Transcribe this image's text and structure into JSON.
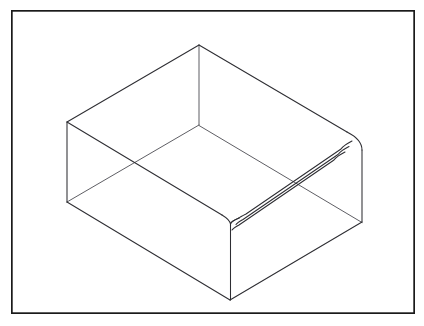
{
  "document": {
    "title": "Isometric Open Box Line Drawing",
    "subject": "open rectangular tray",
    "style": "technical wireframe line drawing",
    "background_color": "#ffffff",
    "line_color": "#2e2e33",
    "hidden_line_color": "#55555c",
    "frame_color": "#1a1a1a"
  },
  "frame": {
    "name": "page-border",
    "x": 11,
    "y": 10,
    "width": 404,
    "height": 304,
    "stroke_width": 1.7
  },
  "geometry": {
    "projection": "isometric",
    "description": "Open-topped rectangular box viewed from above-front, drawn in wireframe with hidden edges visible and a banded rim along the right-front wall.",
    "points": {
      "top_back": [
        199,
        45
      ],
      "top_left": [
        67,
        122
      ],
      "top_right": [
        355,
        142
      ],
      "top_front": [
        230,
        222
      ],
      "bottom_back": [
        199,
        125
      ],
      "bottom_left": [
        67,
        202
      ],
      "bottom_right": [
        362,
        222
      ],
      "bottom_front": [
        230,
        300
      ]
    },
    "rim_band": {
      "description": "Three parallel lines along the right-hand top rim forming wall thickness",
      "offsets": [
        0,
        5,
        10
      ],
      "corner_radius": 9
    },
    "outer_outline": "M199,45 L67,122 L67,202 L230,300 L362,222 L355,142 Z",
    "vertical_edges": [
      {
        "name": "back-vertical",
        "from": [
          199,
          45
        ],
        "to": [
          199,
          125
        ],
        "hidden": true
      },
      {
        "name": "left-vertical",
        "from": [
          67,
          122
        ],
        "to": [
          67,
          202
        ],
        "hidden": false
      },
      {
        "name": "right-vertical",
        "from": [
          362,
          148
        ],
        "to": [
          362,
          222
        ],
        "hidden": false
      },
      {
        "name": "front-vertical",
        "from": [
          230,
          222
        ],
        "to": [
          230,
          300
        ],
        "hidden": false
      }
    ],
    "floor_edges": [
      {
        "name": "floor-back-left",
        "from": [
          199,
          125
        ],
        "to": [
          67,
          202
        ],
        "hidden": true
      },
      {
        "name": "floor-back-right",
        "from": [
          199,
          125
        ],
        "to": [
          340,
          208
        ],
        "hidden": true
      },
      {
        "name": "floor-front-left",
        "from": [
          67,
          202
        ],
        "to": [
          230,
          300
        ],
        "hidden": false
      },
      {
        "name": "floor-front-right",
        "from": [
          230,
          300
        ],
        "to": [
          362,
          222
        ],
        "hidden": false
      }
    ],
    "top_rim_edges": [
      {
        "name": "rim-back-left",
        "from": [
          199,
          45
        ],
        "to": [
          67,
          122
        ]
      },
      {
        "name": "rim-back-right",
        "from": [
          199,
          45
        ],
        "to": [
          355,
          142
        ]
      },
      {
        "name": "rim-front-left",
        "from": [
          67,
          122
        ],
        "to": [
          230,
          222
        ]
      },
      {
        "name": "rim-front-right",
        "from": [
          230,
          222
        ],
        "to": [
          355,
          142
        ]
      }
    ]
  },
  "labels": {
    "none": ""
  }
}
